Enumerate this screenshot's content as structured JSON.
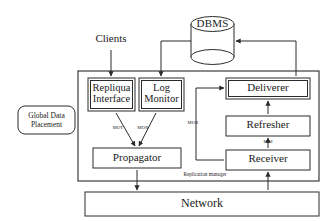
{
  "diagram": {
    "colors": {
      "stroke": "#2b2b2b",
      "text": "#1a1a1a",
      "background": "#ffffff"
    },
    "external": {
      "clients_label": "Clients",
      "dbms_label": "DBMS",
      "network_label": "Network",
      "global_data_placement_label": "Global Data\nPlacement"
    },
    "container": {
      "caption": "Replication manager"
    },
    "components": [
      {
        "id": "repliqua-interface",
        "label": "Repliqua\nInterface",
        "style": "double"
      },
      {
        "id": "log-monitor",
        "label": "Log\nMonitor",
        "style": "double"
      },
      {
        "id": "propagator",
        "label": "Propagator",
        "style": "single"
      },
      {
        "id": "deliverer",
        "label": "Deliverer",
        "style": "double"
      },
      {
        "id": "refresher",
        "label": "Refresher",
        "style": "single"
      },
      {
        "id": "receiver",
        "label": "Receiver",
        "style": "single"
      }
    ],
    "edge_labels": {
      "interface_to_propagator": "MOT",
      "monitor_to_propagator": "MOR",
      "receiver_to_deliverer": "MOR",
      "receiver_to_refresher": "MOI"
    }
  }
}
